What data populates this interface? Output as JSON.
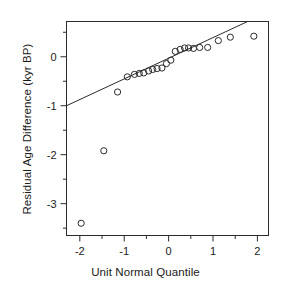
{
  "chart_data": {
    "type": "scatter",
    "title": "",
    "xlabel": "Unit Normal Quantile",
    "ylabel": "Residual Age Difference (kyr BP)",
    "xlim": [
      -2.3,
      2.25
    ],
    "ylim": [
      -3.65,
      0.72
    ],
    "xticks": [
      -2,
      -1,
      0,
      1,
      2
    ],
    "xticklabels": [
      "-2",
      "-1",
      "0",
      "1",
      "2"
    ],
    "xminorticks": [
      -1.5,
      -0.5,
      0.5,
      1.5
    ],
    "yticks": [
      0,
      -1,
      -2,
      -3
    ],
    "yticklabels": [
      "0",
      "-1",
      "-2",
      "-3"
    ],
    "yminorticks": [
      0.5,
      -0.5,
      -1.5,
      -2.5,
      -3.5
    ],
    "grid": false,
    "legend": null,
    "marker": "open-circle",
    "marker_color": "#2b2b2b",
    "line_color": "#2b2b2b",
    "points": [
      {
        "x": -1.97,
        "y": -3.4
      },
      {
        "x": -1.46,
        "y": -1.92
      },
      {
        "x": -1.15,
        "y": -0.72
      },
      {
        "x": -0.93,
        "y": -0.41
      },
      {
        "x": -0.77,
        "y": -0.36
      },
      {
        "x": -0.66,
        "y": -0.34
      },
      {
        "x": -0.56,
        "y": -0.33
      },
      {
        "x": -0.45,
        "y": -0.29
      },
      {
        "x": -0.36,
        "y": -0.26
      },
      {
        "x": -0.26,
        "y": -0.24
      },
      {
        "x": -0.15,
        "y": -0.23
      },
      {
        "x": -0.05,
        "y": -0.14
      },
      {
        "x": 0.05,
        "y": -0.07
      },
      {
        "x": 0.15,
        "y": 0.11
      },
      {
        "x": 0.26,
        "y": 0.15
      },
      {
        "x": 0.36,
        "y": 0.18
      },
      {
        "x": 0.45,
        "y": 0.18
      },
      {
        "x": 0.56,
        "y": 0.17
      },
      {
        "x": 0.7,
        "y": 0.19
      },
      {
        "x": 0.88,
        "y": 0.19
      },
      {
        "x": 1.12,
        "y": 0.33
      },
      {
        "x": 1.39,
        "y": 0.4
      },
      {
        "x": 1.92,
        "y": 0.42
      }
    ],
    "reference_line": {
      "x1": -2.3,
      "y1": -1.0,
      "x2": 1.78,
      "y2": 0.72,
      "slope": 0.42,
      "intercept": -0.035
    }
  }
}
